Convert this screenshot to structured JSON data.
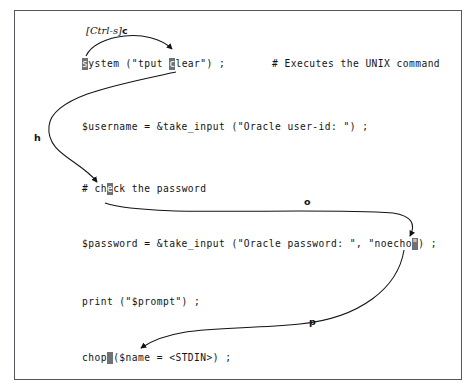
{
  "figure": {
    "kind": "annotated-code-listing",
    "border_color": "#54585c",
    "background": "#ffffff",
    "text_color": "#111316",
    "cursor_color": "#6e7276"
  },
  "code": {
    "lines": [
      {
        "id": "line-system",
        "before": "",
        "cursor": "s",
        "middle": "ystem (\"tput ",
        "cursor2": "c",
        "after": "lear\") ;",
        "comment": "# Executes the UNIX command"
      },
      {
        "id": "line-username",
        "before": "",
        "cursor": "",
        "middle": "",
        "after": "$username = &take_input (\"Oracle user-id: \") ;",
        "comment": ""
      },
      {
        "id": "line-check-comment",
        "before": "# ch",
        "cursor": "e",
        "after": "ck the password",
        "comment": ""
      },
      {
        "id": "line-password",
        "before": "$password = &take_input (\"Oracle password: \", \"noecho",
        "cursor": "\"",
        "after": ") ;",
        "comment": ""
      },
      {
        "id": "line-print",
        "before": "",
        "cursor": "",
        "after": "print (\"$prompt\") ;",
        "comment": ""
      },
      {
        "id": "line-chop",
        "before": "chop",
        "cursor": " ",
        "after": "($name = <STDIN>) ;",
        "comment": ""
      }
    ]
  },
  "annotations": {
    "ctrl_s": {
      "key": "[Ctrl-s]",
      "command": "c"
    },
    "h": {
      "command": "h"
    },
    "o": {
      "command": "o"
    },
    "p": {
      "command": "p"
    }
  }
}
